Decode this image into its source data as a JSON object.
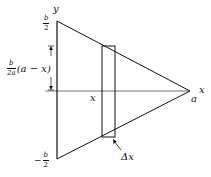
{
  "diagram": {
    "type": "triangle-cross-section",
    "axes": {
      "y_label": "y",
      "x_label": "x",
      "origin_x_label": "x"
    },
    "labels": {
      "top": {
        "sign": "",
        "num": "b",
        "den": "2"
      },
      "bottom": {
        "sign": "−",
        "num": "b",
        "den": "2"
      },
      "apex": "a",
      "half_height": {
        "num": "b",
        "den": "2a",
        "expr": "(a − x)"
      },
      "strip_x": "x",
      "strip_width": "Δx"
    },
    "geometry": {
      "top_vertex": [
        57,
        21
      ],
      "bottom_vertex": [
        57,
        159
      ],
      "apex": [
        190,
        91
      ],
      "strip": {
        "left": 102,
        "right": 115,
        "top": 46,
        "bottom": 137
      },
      "x_axis_y": 91,
      "dimension_arrow_x": 51
    },
    "colors": {
      "stroke": "#111111",
      "background": "#ffffff"
    }
  }
}
